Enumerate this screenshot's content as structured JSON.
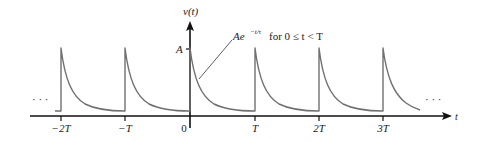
{
  "diagram": {
    "y_axis_label": "v(t)",
    "x_axis_label": "t",
    "amplitude_label": "A",
    "annotation": {
      "expression": "Ae^{-t/τ} for 0 ≤ t < T",
      "base": "Ae",
      "exponent": "−t/τ",
      "condition": " for 0 ≤ t < T"
    },
    "ellipsis_left": "· · ·",
    "ellipsis_right": "· · ·",
    "x_ticks": [
      {
        "label": "−2T",
        "value": -2
      },
      {
        "label": "−T",
        "value": -1
      },
      {
        "label": "0",
        "value": 0
      },
      {
        "label": "T",
        "value": 1
      },
      {
        "label": "2T",
        "value": 2
      },
      {
        "label": "3T",
        "value": 3
      }
    ],
    "colors": {
      "axis": "#111111",
      "curve": "#707070",
      "text": "#222222"
    }
  }
}
